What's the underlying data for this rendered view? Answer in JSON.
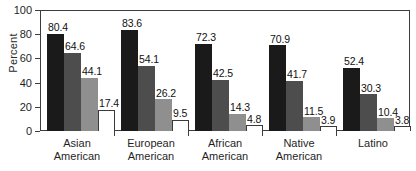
{
  "chart_data": {
    "type": "bar",
    "title": "",
    "xlabel": "",
    "ylabel": "Percent",
    "ylim": [
      0,
      100
    ],
    "yticks": [
      0,
      20,
      40,
      60,
      80,
      100
    ],
    "grid": false,
    "legend": "none",
    "categories": [
      "Asian\nAmerican",
      "European\nAmerican",
      "African\nAmerican",
      "Native\nAmerican",
      "Latino"
    ],
    "series": [
      {
        "name": "series-1",
        "color": "#1a1a1a",
        "values": [
          80.4,
          83.6,
          72.3,
          70.9,
          52.4
        ],
        "labels": [
          "80.4",
          "83.6",
          "72.3",
          "70.9",
          "52.4"
        ]
      },
      {
        "name": "series-2",
        "color": "#4d4d4d",
        "values": [
          64.6,
          54.1,
          42.5,
          41.7,
          30.3
        ],
        "labels": [
          "64.6",
          "54.1",
          "42.5",
          "41.7",
          "30.3"
        ]
      },
      {
        "name": "series-3",
        "color": "#8f8f8f",
        "values": [
          44.1,
          26.2,
          14.3,
          11.5,
          10.4
        ],
        "labels": [
          "44.1",
          "26.2",
          "14.3",
          "11.5",
          "10.4"
        ]
      },
      {
        "name": "series-4",
        "color": "#ffffff",
        "values": [
          17.4,
          9.5,
          4.8,
          3.9,
          3.8
        ],
        "labels": [
          "17.4",
          "9.5",
          "4.8",
          "3.9",
          "3.8"
        ]
      }
    ]
  },
  "axis": {
    "y_tick_labels": [
      "100",
      "80",
      "60",
      "40",
      "20",
      "0"
    ],
    "y_axis_title": "Percent"
  }
}
